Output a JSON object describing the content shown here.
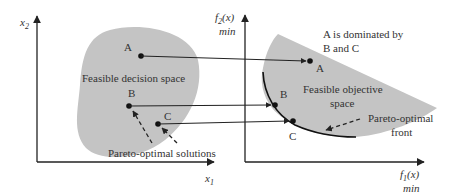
{
  "colors": {
    "region_fill": "#c4c4c4",
    "line": "#222222",
    "text": "#333333",
    "background": "#ffffff"
  },
  "decision_space": {
    "x_axis_label": "x",
    "x_axis_sub": "1",
    "y_axis_label": "x",
    "y_axis_sub": "2",
    "region_label": "Feasible decision space",
    "pareto_label": "Pareto-optimal solutions",
    "points": [
      {
        "id": "A",
        "label": "A"
      },
      {
        "id": "B",
        "label": "B"
      },
      {
        "id": "C",
        "label": "C"
      }
    ]
  },
  "objective_space": {
    "x_axis_label": "f",
    "x_axis_sub": "1",
    "x_axis_arg": "(x)",
    "x_axis_min": "min",
    "y_axis_label": "f",
    "y_axis_sub": "2",
    "y_axis_arg": "(x)",
    "y_axis_min": "min",
    "region_label_line1": "Feasible objective",
    "region_label_line2": "space",
    "front_label_line1": "Pareto-optimal",
    "front_label_line2": "front",
    "dominance_note_line1": "A is dominated by",
    "dominance_note_line2": "B and C",
    "points": [
      {
        "id": "A",
        "label": "A"
      },
      {
        "id": "B",
        "label": "B"
      },
      {
        "id": "C",
        "label": "C"
      }
    ]
  }
}
